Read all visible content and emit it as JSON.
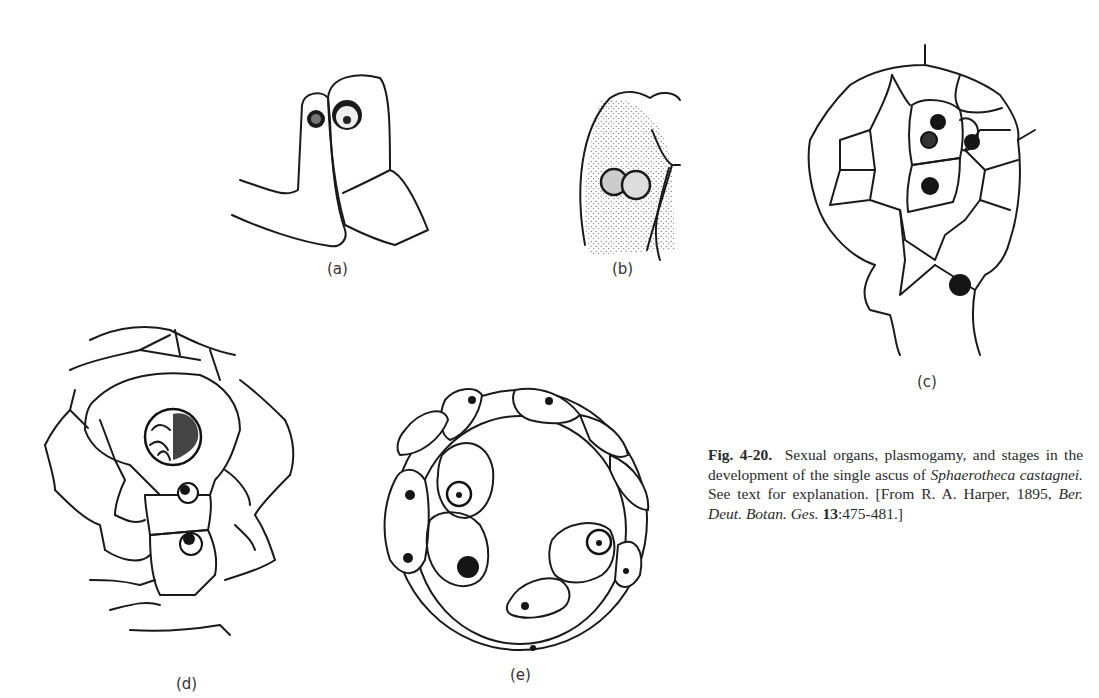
{
  "figure": {
    "number": "Fig. 4-20.",
    "caption_parts": {
      "lead": "Sexual organs, plasmogamy, and stages in the development of the single ascus of ",
      "species": "Sphaerotheca castagnei.",
      "after_species": " See text for explanation. [From R. A. Harper, 1895, ",
      "journal": "Ber. Deut. Botan. Ges.",
      "volume": "13",
      "pages": ":475-481.]"
    },
    "panels": [
      {
        "id": "a",
        "label": "(a)",
        "description": "Antheridium and ascogonium with nuclei (sexual organs)"
      },
      {
        "id": "b",
        "label": "(b)",
        "description": "Plasmogamy, two nuclei fused in cell"
      },
      {
        "id": "c",
        "label": "(c)",
        "description": "Young fruiting body with stippled binucleate cells"
      },
      {
        "id": "d",
        "label": "(d)",
        "description": "Enlarged ascus with large nucleus surrounded by sheath cells"
      },
      {
        "id": "e",
        "label": "(e)",
        "description": "Mature ascus with ascospores inside cleistothecium wall"
      }
    ]
  }
}
